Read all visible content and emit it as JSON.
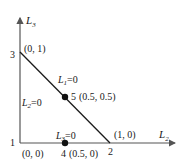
{
  "diagram": {
    "axes": {
      "x_label": "L",
      "x_sub": "2",
      "y_label": "L",
      "y_sub": "3"
    },
    "vertices": [
      {
        "id": "1",
        "coord": "(0, 0)"
      },
      {
        "id": "2",
        "coord": "(1, 0)"
      },
      {
        "id": "3",
        "coord": "(0, 1)"
      },
      {
        "id": "4",
        "coord": "(0.5, 0)"
      },
      {
        "id": "5",
        "coord": "(0.5, 0.5)"
      }
    ],
    "constraints": [
      {
        "label": "L",
        "sub": "1",
        "eq": "=0"
      },
      {
        "label": "L",
        "sub": "2",
        "eq": "=0"
      },
      {
        "label": "L",
        "sub": "3",
        "eq": "=0"
      }
    ],
    "colors": {
      "line": "#1a1a1a",
      "axis": "#555555",
      "point": "#111111"
    }
  }
}
